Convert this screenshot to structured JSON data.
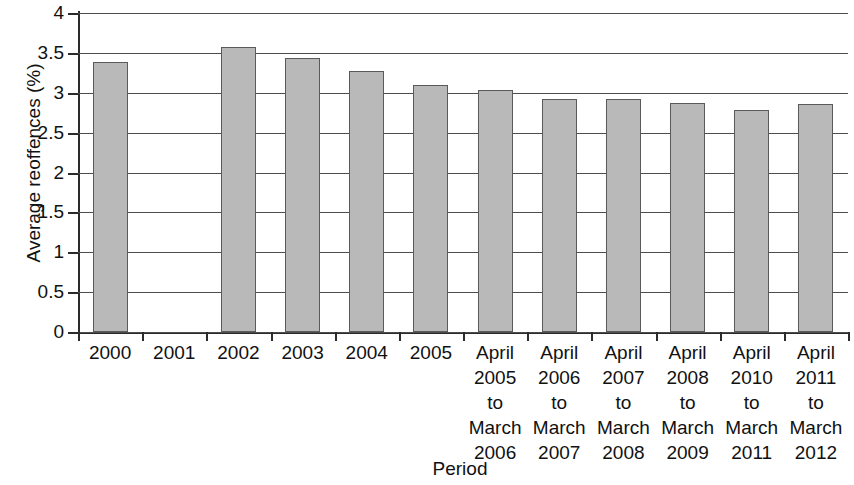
{
  "chart_data": {
    "type": "bar",
    "title": "",
    "xlabel": "Period",
    "ylabel": "Average reoffences (%)",
    "ylim": [
      0,
      4
    ],
    "ytick_labels": [
      "0",
      "0.5",
      "1",
      "1.5",
      "2",
      "2.5",
      "3",
      "3.5",
      "4"
    ],
    "ytick_values": [
      0,
      0.5,
      1,
      1.5,
      2,
      2.5,
      3,
      3.5,
      4
    ],
    "grid": true,
    "legend": "none",
    "bar_color": "#b9b9b9",
    "bar_edge_color": "#5a5a5a",
    "categories": [
      "2000",
      "2001",
      "2002",
      "2003",
      "2004",
      "2005",
      "April\n2005\nto\nMarch\n2006",
      "April\n2006\nto\nMarch\n2007",
      "April\n2007\nto\nMarch\n2008",
      "April\n2008\nto\nMarch\n2009",
      "April\n2010\nto\nMarch\n2011",
      "April\n2011\nto\nMarch\n2012"
    ],
    "values": [
      3.39,
      null,
      3.58,
      3.43,
      3.27,
      3.1,
      3.04,
      2.92,
      2.92,
      2.87,
      2.79,
      2.86
    ]
  }
}
